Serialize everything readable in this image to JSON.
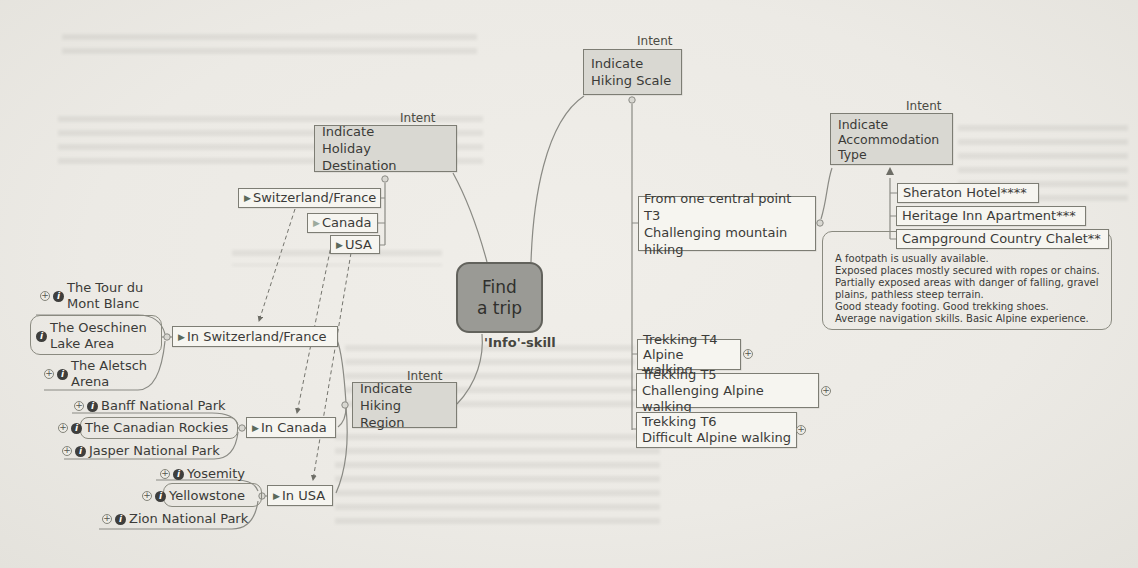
{
  "canvas": {
    "bg": "#edebe6",
    "line_color": "#8a8a84"
  },
  "center": {
    "title": "Find\na trip",
    "skill": "'Info'-skill"
  },
  "intents": {
    "holiday": {
      "tag": "Intent",
      "title": "Indicate\nHoliday Destination"
    },
    "scale": {
      "tag": "Intent",
      "title": "Indicate\nHiking Scale"
    },
    "region": {
      "tag": "Intent",
      "title": "Indicate\nHiking Region"
    },
    "accommodation": {
      "tag": "Intent",
      "title": "Indicate\nAccommodation\nType"
    }
  },
  "destinations": [
    {
      "label": "Switzerland/France"
    },
    {
      "label": "Canada"
    },
    {
      "label": "USA"
    }
  ],
  "regions": [
    {
      "label": "In Switzerland/France"
    },
    {
      "label": "In Canada"
    },
    {
      "label": "In USA"
    }
  ],
  "areas": {
    "swiss": [
      {
        "label": "The Tour du\nMont Blanc"
      },
      {
        "label": "The Oeschinen\nLake Area"
      },
      {
        "label": "The Aletsch\nArena"
      }
    ],
    "canada": [
      {
        "label": "Banff National Park"
      },
      {
        "label": "The Canadian Rockies"
      },
      {
        "label": "Jasper National Park"
      }
    ],
    "usa": [
      {
        "label": "Yosemity"
      },
      {
        "label": "Yellowstone"
      },
      {
        "label": "Zion National Park"
      }
    ]
  },
  "scales": [
    {
      "label": "From one central point T3\nChallenging mountain\nhiking"
    },
    {
      "label": "Trekking T4\nAlpine walking"
    },
    {
      "label": "Trekking T5\nChallenging Alpine walking"
    },
    {
      "label": "Trekking T6\nDifficult Alpine walking"
    }
  ],
  "accommodations": [
    {
      "label": "Sheraton Hotel****"
    },
    {
      "label": "Heritage Inn Apartment***"
    },
    {
      "label": "Campground Country Chalet**"
    }
  ],
  "scale_notes": [
    "A footpath is usually available.",
    "Exposed places mostly secured with ropes or chains.",
    "Partially exposed areas with danger of falling, gravel",
    "plains, pathless steep terrain.",
    "Good steady footing. Good trekking shoes.",
    "Average navigation skills. Basic Alpine experience."
  ],
  "icons": {
    "expand_glyph": "+",
    "info_glyph": "i",
    "flag_glyph": "▶"
  }
}
